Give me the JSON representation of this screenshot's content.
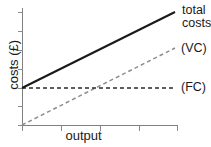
{
  "figure": {
    "background_color": "#ffffff",
    "width": 211,
    "height": 147
  },
  "labels": {
    "total_costs_line1": "total",
    "total_costs_line2": "costs",
    "variable_costs": "(VC)",
    "fixed_costs": "(FC)",
    "x_axis": "output",
    "y_axis": "costs (£)"
  },
  "colors": {
    "total_costs": "#1a1a1a",
    "variable_costs": "#8e8e8e",
    "fixed_costs": "#2b2b2b",
    "axis": "#808080"
  },
  "chart_data": {
    "type": "line",
    "title": "",
    "subtitle": "",
    "xlabel": "output",
    "ylabel": "costs (£)",
    "xlim": [
      0,
      4
    ],
    "ylim": [
      0,
      6
    ],
    "grid": false,
    "legend_position": "right-of-plot-line-ends",
    "x_tick_labels": [
      "",
      "",
      "",
      "",
      ""
    ],
    "y_tick_labels": [
      "",
      "",
      "",
      "",
      "",
      "",
      ""
    ],
    "x_ticks": [
      0,
      1,
      2,
      3,
      4
    ],
    "y_ticks": [
      0,
      1,
      2,
      3,
      4,
      5,
      6
    ],
    "annotations": [
      {
        "text": "total costs",
        "target": "total-costs-line-end"
      },
      {
        "text": "(VC)",
        "target": "variable-costs-line-end"
      },
      {
        "text": "(FC)",
        "target": "fixed-costs-line-end"
      }
    ],
    "series": [
      {
        "name": "total costs",
        "style": "solid",
        "color": "#1a1a1a",
        "x": [
          0,
          4
        ],
        "values": [
          1.9,
          5.8
        ]
      },
      {
        "name": "(VC)",
        "style": "dashed",
        "color": "#8e8e8e",
        "x": [
          0,
          4
        ],
        "values": [
          0.0,
          3.95
        ]
      },
      {
        "name": "(FC)",
        "style": "dashed",
        "color": "#2b2b2b",
        "x": [
          0,
          3.92
        ],
        "values": [
          1.9,
          1.9
        ]
      }
    ]
  },
  "geometry": {
    "axis_origin_x": 22,
    "axis_origin_y": 125,
    "axis_top_y": 8,
    "axis_right_x": 178,
    "x_tick_positions": [
      22,
      61,
      100,
      139,
      177
    ],
    "y_tick_positions": [
      125,
      106,
      88,
      69,
      50,
      31,
      12
    ],
    "total_costs_path": "M22,88 L175,12",
    "variable_costs_path": "M22,125 L175,48",
    "fixed_costs_path": "M22,88 L173,88"
  }
}
